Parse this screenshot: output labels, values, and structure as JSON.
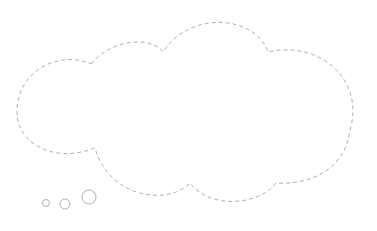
{
  "diagram": {
    "type": "thought-bubble",
    "stroke_color": "#b0b0b0",
    "fill_color": "#ffffff",
    "outline_style": "dashed",
    "trail_circles": [
      {
        "cx": 46,
        "cy": 203,
        "r": 3.5
      },
      {
        "cx": 65,
        "cy": 204,
        "r": 5
      },
      {
        "cx": 89,
        "cy": 197,
        "r": 7
      }
    ]
  }
}
